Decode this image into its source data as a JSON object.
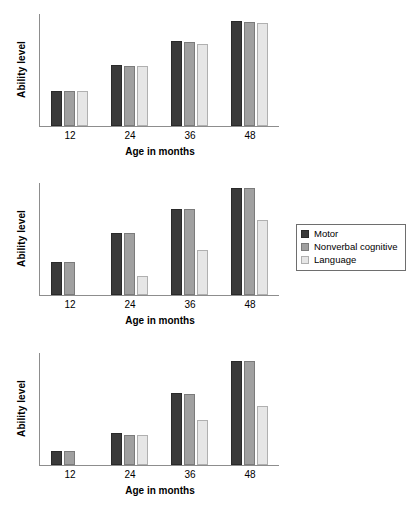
{
  "legend": {
    "position": "right-of-middle-panel",
    "entries": [
      {
        "label": "Motor",
        "color": "#3a3a3a",
        "icon": "square-swatch-icon"
      },
      {
        "label": "Nonverbal cognitive",
        "color": "#a0a0a0",
        "icon": "square-swatch-icon"
      },
      {
        "label": "Language",
        "color": "#e6e6e6",
        "icon": "square-swatch-icon"
      }
    ]
  },
  "axis_titles": {
    "y": "Ability level",
    "x": "Age in months"
  },
  "ticks": [
    "12",
    "24",
    "36",
    "48"
  ],
  "chart_data": [
    {
      "type": "bar",
      "title": "",
      "xlabel": "Age in months",
      "ylabel": "Ability level",
      "categories": [
        "12",
        "24",
        "36",
        "48"
      ],
      "ylim": [
        0,
        100
      ],
      "grid": false,
      "legend_position": "right",
      "series": [
        {
          "name": "Motor",
          "color": "#3a3a3a",
          "values": [
            31,
            54,
            75,
            93
          ]
        },
        {
          "name": "Nonverbal cognitive",
          "color": "#a0a0a0",
          "values": [
            31,
            53,
            74,
            92
          ]
        },
        {
          "name": "Language",
          "color": "#e6e6e6",
          "values": [
            31,
            53,
            73,
            91
          ]
        }
      ]
    },
    {
      "type": "bar",
      "title": "",
      "xlabel": "Age in months",
      "ylabel": "Ability level",
      "categories": [
        "12",
        "24",
        "36",
        "48"
      ],
      "ylim": [
        0,
        100
      ],
      "grid": false,
      "legend_position": "right",
      "series": [
        {
          "name": "Motor",
          "color": "#3a3a3a",
          "values": [
            29,
            55,
            76,
            95
          ]
        },
        {
          "name": "Nonverbal cognitive",
          "color": "#a0a0a0",
          "values": [
            29,
            55,
            76,
            95
          ]
        },
        {
          "name": "Language",
          "color": "#e6e6e6",
          "values": [
            0,
            17,
            40,
            66
          ]
        }
      ]
    },
    {
      "type": "bar",
      "title": "",
      "xlabel": "Age in months",
      "ylabel": "Ability level",
      "categories": [
        "12",
        "24",
        "36",
        "48"
      ],
      "ylim": [
        0,
        100
      ],
      "grid": false,
      "legend_position": "right",
      "series": [
        {
          "name": "Motor",
          "color": "#3a3a3a",
          "values": [
            12,
            28,
            64,
            92
          ]
        },
        {
          "name": "Nonverbal cognitive",
          "color": "#a0a0a0",
          "values": [
            12,
            27,
            63,
            92
          ]
        },
        {
          "name": "Language",
          "color": "#e6e6e6",
          "values": [
            0,
            27,
            40,
            52
          ]
        }
      ]
    }
  ]
}
